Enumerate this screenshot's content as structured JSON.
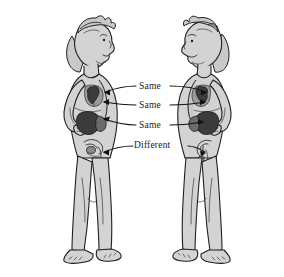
{
  "figure": {
    "background_color": "#ffffff",
    "skin_color": "#d3d3d3",
    "outline_color": "#1a1a1a",
    "organ_dark_color": "#4a4a4a",
    "organ_darkest_color": "#2e2e2e",
    "organ_mid_color": "#6e6e6e"
  },
  "labels": [
    {
      "id": "row-1",
      "text": "Same",
      "x": 139,
      "y": 84,
      "organ": "lungs"
    },
    {
      "id": "row-2",
      "text": "Same",
      "x": 139,
      "y": 103,
      "organ": "heart"
    },
    {
      "id": "row-3",
      "text": "Same",
      "x": 139,
      "y": 123,
      "organ": "stomach-liver"
    },
    {
      "id": "row-4",
      "text": "Different",
      "x": 134,
      "y": 143,
      "organ": "reproductive-organs"
    }
  ],
  "people": [
    {
      "id": "left-figure",
      "description": "Child standing in profile facing right, hand on hip"
    },
    {
      "id": "right-figure",
      "description": "Child standing in profile facing left, hand on hip"
    }
  ]
}
